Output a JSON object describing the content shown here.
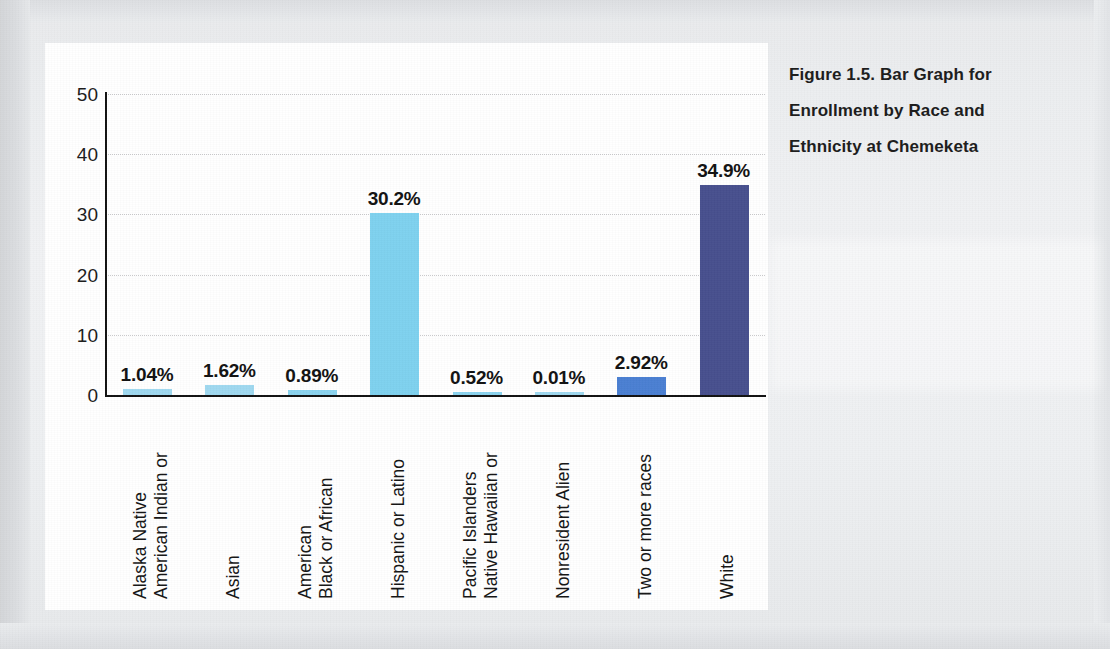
{
  "caption": {
    "lines": [
      "Figure 1.5. Bar Graph for",
      "Enrollment by Race and",
      "Ethnicity at Chemeketa"
    ],
    "full": "Figure 1.5. Bar Graph for Enrollment by Race and Ethnicity at Chemeketa"
  },
  "colors": {
    "light_blue": "#7ed1ef",
    "medium_blue": "#4a7fd2",
    "dark_navy": "#474f8e",
    "axis": "#111111",
    "gridline": "#c9c9cb",
    "card_background": "#ffffff",
    "page_background": "#eceef0"
  },
  "chart_data": {
    "type": "bar",
    "title": "Figure 1.5. Bar Graph for Enrollment by Race and Ethnicity at Chemeketa",
    "xlabel": "",
    "ylabel": "",
    "ylim": [
      0,
      50
    ],
    "yticks": [
      0,
      10,
      20,
      30,
      40,
      50
    ],
    "ytick_labels": [
      "0",
      "10",
      "20",
      "30",
      "40",
      "50"
    ],
    "grid": true,
    "grid_axis": "y",
    "legend": false,
    "categories": [
      "American Indian or Alaska Native",
      "Asian",
      "Black or African American",
      "Hispanic or Latino",
      "Native Hawaiian or Pacific Islanders",
      "Nonresident Alien",
      "Two or more races",
      "White"
    ],
    "category_lines": [
      [
        "American Indian or",
        "Alaska Native"
      ],
      [
        "Asian"
      ],
      [
        "Black or African",
        "American"
      ],
      [
        "Hispanic or Latino"
      ],
      [
        "Native Hawaiian or",
        "Pacific Islanders"
      ],
      [
        "Nonresident Alien"
      ],
      [
        "Two or more races"
      ],
      [
        "White"
      ]
    ],
    "values": [
      1.04,
      1.62,
      0.89,
      30.2,
      0.52,
      0.01,
      2.92,
      34.9
    ],
    "data_labels": [
      "1.04%",
      "1.62%",
      "0.89%",
      "30.2%",
      "0.52%",
      "0.01%",
      "2.92%",
      "34.9%"
    ],
    "bar_colors": [
      "#9fd9f0",
      "#9fd9f0",
      "#8bd3ef",
      "#7ed1ef",
      "#8bd3ef",
      "#9fd9f0",
      "#4a7fd2",
      "#474f8e"
    ]
  }
}
